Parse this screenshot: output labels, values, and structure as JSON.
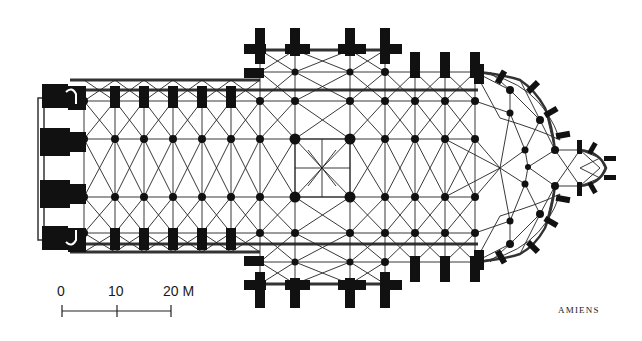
{
  "diagram": {
    "type": "architectural floor plan",
    "caption": "AMIENS",
    "colors": {
      "ink": "#111111",
      "background": "#ffffff",
      "wall_fill": "#e8e8e8"
    },
    "scale_bar": {
      "labels": [
        "0",
        "10",
        "20 M"
      ],
      "unit": "M"
    },
    "parts": [
      "west facade with towers",
      "nave",
      "side aisles",
      "transept",
      "crossing",
      "choir",
      "ambulatory",
      "radiating chapels",
      "axial chapel"
    ]
  }
}
